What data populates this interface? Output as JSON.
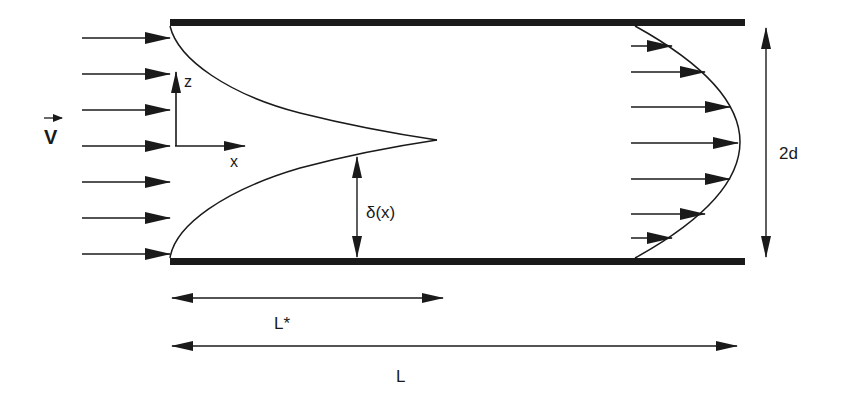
{
  "diagram": {
    "colors": {
      "ink": "#1a1a1a",
      "background": "#ffffff"
    },
    "labels": {
      "velocity": "V",
      "z_axis": "z",
      "x_axis": "x",
      "boundary_layer": "δ(x)",
      "gap": "2d",
      "entrance_length": "L*",
      "total_length": "L"
    },
    "inlet_arrows_y": [
      38,
      74,
      110,
      146,
      182,
      218,
      254
    ],
    "outlet_profile_arrows": [
      {
        "y": 46,
        "x_end": 672
      },
      {
        "y": 72,
        "x_end": 705
      },
      {
        "y": 107,
        "x_end": 730
      },
      {
        "y": 143,
        "x_end": 738
      },
      {
        "y": 179,
        "x_end": 730
      },
      {
        "y": 214,
        "x_end": 705
      },
      {
        "y": 238,
        "x_end": 672
      }
    ]
  }
}
